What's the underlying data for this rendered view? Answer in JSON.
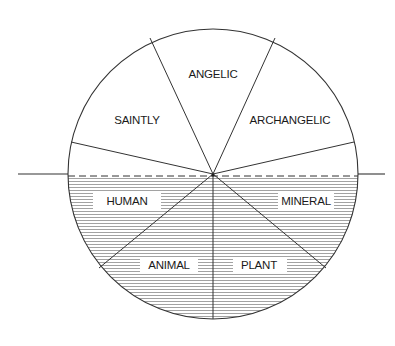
{
  "diagram": {
    "type": "circle-divided-hierarchy",
    "colors": {
      "stroke": "#333333",
      "hatch": "#8a8a8a",
      "background": "#ffffff",
      "text": "#1a1a1a"
    },
    "upper_segments": [
      {
        "label": "SAINTLY"
      },
      {
        "label": "ANGELIC"
      },
      {
        "label": "ARCHANGELIC"
      }
    ],
    "lower_segments": [
      {
        "label": "HUMAN"
      },
      {
        "label": "ANIMAL"
      },
      {
        "label": "PLANT"
      },
      {
        "label": "MINERAL"
      }
    ],
    "labels": {
      "angelic": "ANGELIC",
      "saintly": "SAINTLY",
      "archangelic": "ARCHANGELIC",
      "human": "HUMAN",
      "mineral": "MINERAL",
      "animal": "ANIMAL",
      "plant": "PLANT"
    }
  }
}
